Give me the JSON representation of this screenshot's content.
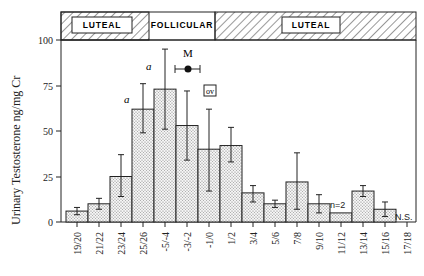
{
  "chart_data": {
    "type": "bar",
    "title": "",
    "xlabel": "",
    "ylabel": "Urinary Testosterone ng/mg Cr",
    "ylim": [
      0,
      100
    ],
    "yticks": [
      0,
      25,
      50,
      75,
      100
    ],
    "grid": false,
    "categories": [
      "19/20",
      "21/22",
      "23/24",
      "25/26",
      "-5/-4",
      "-3/-2",
      "-1/0",
      "1/2",
      "3/4",
      "5/6",
      "7/8",
      "9/10",
      "11/12",
      "13/14",
      "15/16",
      "17/18"
    ],
    "values": [
      6,
      10,
      25,
      62,
      73,
      53,
      40,
      42,
      16,
      10,
      22,
      10,
      5,
      17,
      7,
      null
    ],
    "error_low": [
      4,
      7,
      14,
      49,
      51,
      34,
      17,
      33,
      11,
      8,
      7,
      5,
      null,
      14,
      3,
      null
    ],
    "error_high": [
      8,
      13,
      37,
      76,
      95,
      72,
      62,
      52,
      20,
      12,
      38,
      15,
      null,
      20,
      11,
      null
    ],
    "phases": [
      {
        "label": "LUTEAL",
        "from": 0,
        "to": 4,
        "hatched": true
      },
      {
        "label": "FOLLICULAR",
        "from": 4,
        "to": 6,
        "hatched": false
      },
      {
        "label": "LUTEAL",
        "from": 6,
        "to": 16,
        "hatched": true
      }
    ],
    "annotations": [
      {
        "text": "a",
        "category": "25/26"
      },
      {
        "text": "a",
        "category": "-5/-4"
      },
      {
        "text": "M",
        "note": "menses marker with horizontal range"
      },
      {
        "text": "ov",
        "note": "ovulation marker"
      },
      {
        "text": "n=2",
        "category": "11/12"
      },
      {
        "text": "N.S.",
        "category": "17/18"
      }
    ]
  },
  "labels": {
    "ylabel": "Urinary Testosterone ng/mg Cr",
    "phase1": "LUTEAL",
    "phase2": "FOLLICULAR",
    "phase3": "LUTEAL",
    "a1": "a",
    "a2": "a",
    "m": "M",
    "ov": "ov",
    "n2": "n=2",
    "ns": "N.S.",
    "yt0": "0",
    "yt25": "25",
    "yt50": "50",
    "yt75": "75",
    "yt100": "100"
  }
}
